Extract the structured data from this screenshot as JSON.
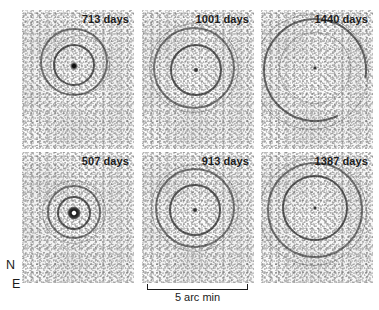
{
  "figure": {
    "type": "image-panel-grid",
    "rows": 2,
    "columns": 3,
    "background_color": "#ffffff",
    "ink_color": "#1b1b1b"
  },
  "panels": [
    {
      "id": "panel-713",
      "label": "713 days",
      "row": 1,
      "column": 1,
      "x": 22,
      "y": 10,
      "width": 112,
      "height": 139,
      "rings": [
        {
          "name": "outer-ring",
          "cx": 52,
          "cy": 52,
          "r": 34,
          "style": "outer"
        },
        {
          "name": "inner-ring",
          "cx": 52,
          "cy": 55,
          "r": 21,
          "style": "inner"
        },
        {
          "name": "outer-arc-fragment",
          "cx": 58,
          "cy": 55,
          "r": 30,
          "style": "faint"
        }
      ],
      "core": {
        "cx": 52,
        "cy": 56,
        "d": 8,
        "style": "normal"
      }
    },
    {
      "id": "panel-1001",
      "label": "1001 days",
      "row": 1,
      "column": 2,
      "x": 142,
      "y": 10,
      "width": 112,
      "height": 139,
      "rings": [
        {
          "name": "outer-ring",
          "cx": 52,
          "cy": 58,
          "r": 41,
          "style": "outer"
        },
        {
          "name": "inner-ring",
          "cx": 54,
          "cy": 60,
          "r": 26,
          "style": "inner"
        },
        {
          "name": "outer-arc-fragment",
          "cx": 52,
          "cy": 58,
          "r": 45,
          "style": "faint"
        }
      ],
      "core": {
        "cx": 54,
        "cy": 60,
        "d": 5,
        "style": "tiny"
      }
    },
    {
      "id": "panel-1440",
      "label": "1440 days",
      "row": 1,
      "column": 3,
      "x": 261,
      "y": 10,
      "width": 112,
      "height": 139,
      "rings": [
        {
          "name": "outer-ring",
          "cx": 54,
          "cy": 60,
          "r": 52,
          "style": "broken"
        },
        {
          "name": "inner-ring",
          "cx": 54,
          "cy": 58,
          "r": 36,
          "style": "faint"
        },
        {
          "name": "outer-arc-fragment",
          "cx": 50,
          "cy": 62,
          "r": 58,
          "style": "faint"
        }
      ],
      "core": {
        "cx": 54,
        "cy": 58,
        "d": 4,
        "style": "tiny"
      }
    },
    {
      "id": "panel-507",
      "label": "507 days",
      "row": 2,
      "column": 1,
      "x": 22,
      "y": 152,
      "width": 112,
      "height": 131,
      "rings": [
        {
          "name": "outer-ring",
          "cx": 52,
          "cy": 60,
          "r": 27,
          "style": "outer"
        },
        {
          "name": "inner-ring",
          "cx": 52,
          "cy": 61,
          "r": 17,
          "style": "inner"
        },
        {
          "name": "outer-arc-fragment",
          "cx": 52,
          "cy": 60,
          "r": 32,
          "style": "faint"
        }
      ],
      "core": {
        "cx": 52,
        "cy": 61,
        "d": 11,
        "style": "bright"
      }
    },
    {
      "id": "panel-913",
      "label": "913 days",
      "row": 2,
      "column": 2,
      "x": 142,
      "y": 152,
      "width": 112,
      "height": 131,
      "rings": [
        {
          "name": "outer-ring",
          "cx": 53,
          "cy": 56,
          "r": 40,
          "style": "outer"
        },
        {
          "name": "inner-ring",
          "cx": 53,
          "cy": 58,
          "r": 26,
          "style": "inner"
        },
        {
          "name": "outer-arc-fragment",
          "cx": 53,
          "cy": 56,
          "r": 44,
          "style": "faint"
        }
      ],
      "core": {
        "cx": 53,
        "cy": 58,
        "d": 5,
        "style": "tiny"
      }
    },
    {
      "id": "panel-1387",
      "label": "1387 days",
      "row": 2,
      "column": 3,
      "x": 261,
      "y": 152,
      "width": 112,
      "height": 131,
      "rings": [
        {
          "name": "outer-ring",
          "cx": 54,
          "cy": 58,
          "r": 48,
          "style": "outer"
        },
        {
          "name": "inner-ring",
          "cx": 54,
          "cy": 56,
          "r": 33,
          "style": "inner"
        },
        {
          "name": "outer-arc-fragment",
          "cx": 52,
          "cy": 60,
          "r": 54,
          "style": "faint"
        }
      ],
      "core": {
        "cx": 54,
        "cy": 56,
        "d": 4,
        "style": "tiny"
      }
    }
  ],
  "compass": {
    "north_label": "N",
    "east_label": "E"
  },
  "scalebar": {
    "caption": "5 arc min",
    "length_px": 101
  }
}
